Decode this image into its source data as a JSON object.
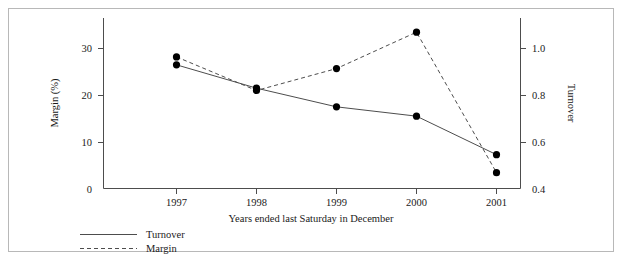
{
  "chart_data": {
    "type": "line",
    "title": "",
    "xlabel": "Years ended last Saturday in December",
    "categories": [
      "1997",
      "1998",
      "1999",
      "2000",
      "2001"
    ],
    "grid": false,
    "legend_position": "bottom-left",
    "axes": {
      "left": {
        "label": "Margin (%)",
        "ticks": [
          "0",
          "10",
          "20",
          "30"
        ],
        "tick_values": [
          0,
          10,
          20,
          30
        ],
        "lim": [
          0,
          35.5
        ],
        "series": "Margin"
      },
      "right": {
        "label": "Turnover",
        "ticks": [
          "0.4",
          "0.6",
          "0.8",
          "1.0"
        ],
        "tick_values": [
          0.4,
          0.6,
          0.8,
          1.0
        ],
        "lim": [
          0.4,
          1.1512
        ],
        "series": "Turnover"
      }
    },
    "series": [
      {
        "name": "Turnover",
        "axis": "right",
        "style": "solid",
        "marker": "filled-circle",
        "values": [
          0.93,
          0.83,
          0.75,
          0.71,
          0.545
        ]
      },
      {
        "name": "Margin",
        "axis": "left",
        "style": "dashed",
        "marker": "filled-circle",
        "values": [
          28.2,
          21.0,
          25.7,
          33.5,
          3.4
        ]
      }
    ]
  },
  "legend": {
    "items": [
      {
        "label": "Turnover",
        "style": "solid"
      },
      {
        "label": "Margin",
        "style": "dashed"
      }
    ]
  },
  "colors": {
    "line": "#4d4d4d",
    "marker": "#000000",
    "frame": "#b8b8b8",
    "text": "#1a1a1a",
    "background": "#ffffff"
  }
}
